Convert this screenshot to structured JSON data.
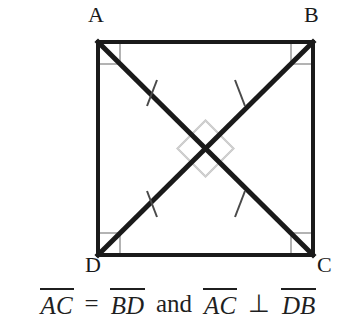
{
  "figure": {
    "shape_name": "square-ABCD",
    "vertices": {
      "A": "A",
      "B": "B",
      "C": "C",
      "D": "D"
    },
    "colors": {
      "stroke": "#1a1a1a",
      "diagonal": "#1a1a1a",
      "right_angle_mark": "#b3b3b3",
      "tick_mark": "#3a3a3a",
      "background": "#ffffff",
      "text": "#1f1f1f"
    },
    "geometry": {
      "left": 98,
      "top": 42,
      "right": 313,
      "bottom": 255,
      "center_x": 205.5,
      "center_y": 148.5,
      "border_width": 4,
      "diagonal_width": 5,
      "corner_mark_size": 22,
      "center_mark_size": 26
    },
    "marks": {
      "corner_right_angles": [
        "A",
        "B",
        "C",
        "D"
      ],
      "center_right_angles": 4,
      "diagonal_ticks": 4,
      "tick_description": "single congruence tick on each diagonal half-segment"
    },
    "diagonals": [
      {
        "name": "AC",
        "from": "A",
        "to": "C"
      },
      {
        "name": "BD",
        "from": "B",
        "to": "D"
      }
    ]
  },
  "caption": {
    "segment_1": "AC",
    "equals": "=",
    "segment_2": "BD",
    "conjunction": "and",
    "segment_3": "AC",
    "perpendicular": "⊥",
    "segment_4": "DB",
    "full_text": "AC = BD and AC ⊥ DB"
  }
}
